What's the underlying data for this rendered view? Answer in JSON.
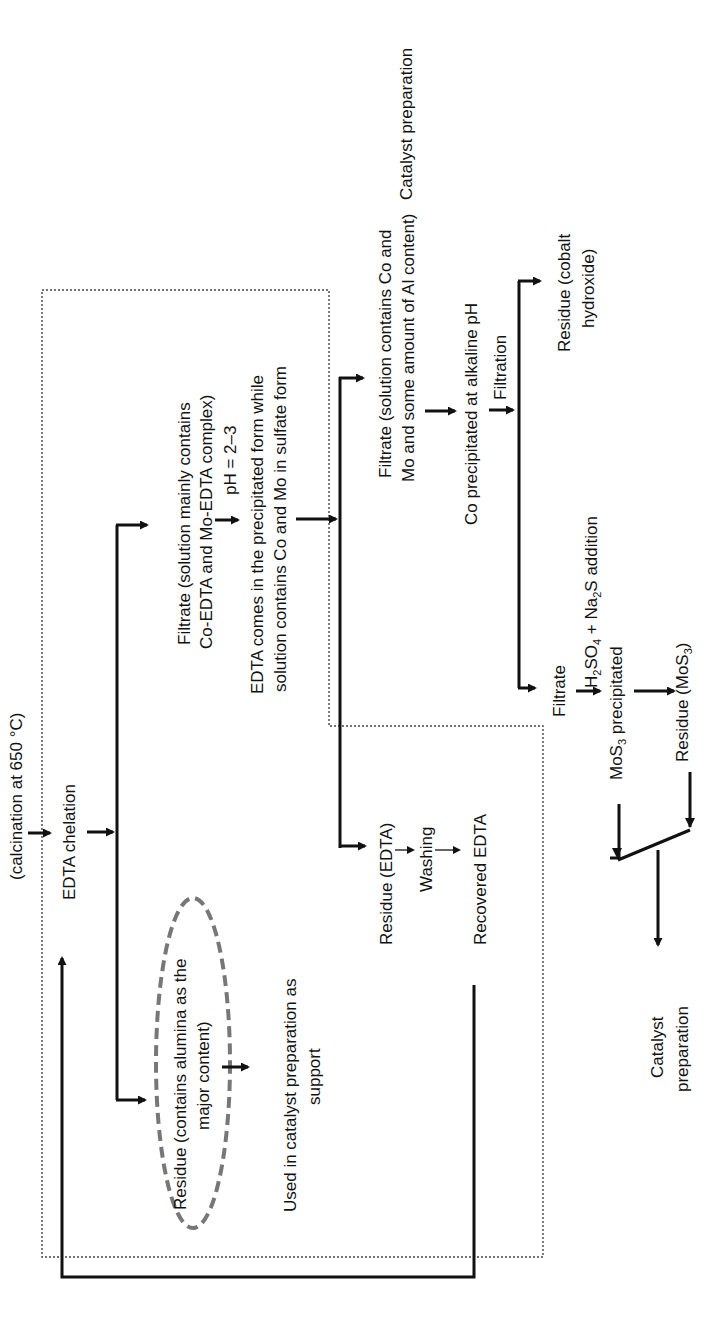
{
  "diagram": {
    "orientation": "rotated -90deg (text reads bottom-to-top)",
    "nodes": {
      "calcination": "(calcination at 650 °C)",
      "edta_chelation": "EDTA chelation",
      "filtrate1_line1": "Filtrate (solution mainly contains",
      "filtrate1_line2": "Co-EDTA and Mo-EDTA complex)",
      "ph_condition": "pH = 2–3",
      "edta_precip_line1": "EDTA comes in the precipitated form while",
      "edta_precip_line2": "solution contains Co and Mo in sulfate form",
      "residue_alumina_line1": "Residue (contains alumina as the",
      "residue_alumina_line2": "major content)",
      "used_support_line1": "Used in catalyst preparation as",
      "used_support_line2": "support",
      "residue_edta": "Residue (EDTA)",
      "washing": "Washing",
      "recovered_edta": "Recovered EDTA",
      "filtrate2_line1": "Filtrate (solution contains Co and",
      "filtrate2_line2": "Mo and some amount of Al content)",
      "co_precip": "Co precipitated at alkaline pH",
      "filtration": "Filtration",
      "residue_cobalt_line1": "Residue (cobalt",
      "residue_cobalt_line2": "hydroxide)",
      "catalyst_prep_top": "Catalyst preparation",
      "filtrate3": "Filtrate",
      "acid_addition": {
        "h": "H",
        "h_sub": "2",
        "so": "SO",
        "so_sub": "4",
        "plus_na": " + Na",
        "na_sub": "2",
        "s_addition": "S addition"
      },
      "mos3_precip": {
        "mos": "MoS",
        "mos_sub": "3",
        "rest": " precipitated"
      },
      "residue_mos3": {
        "pre": "Residue (MoS",
        "sub": "3",
        "post": ")"
      },
      "catalyst_prep_bottom_line1": "Catalyst",
      "catalyst_prep_bottom_line2": "preparation"
    },
    "colors": {
      "line": "#111111",
      "dotted_box": "#444444",
      "ellipse": "#777777",
      "background": "#ffffff"
    }
  }
}
